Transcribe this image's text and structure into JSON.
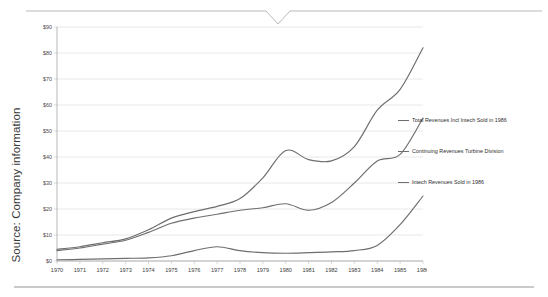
{
  "source_note": "Source: Company information",
  "decoration": {
    "top_rule_name": "top-divider-with-notch",
    "bottom_rule_name": "bottom-divider"
  },
  "legend": {
    "position": "right",
    "items": [
      {
        "label": "Total Revenues Incl Intech  Sold in 1986",
        "color": "#6e6e6e"
      },
      {
        "label": "Continuing Revenues Turbine Division",
        "color": "#6e6e6e"
      },
      {
        "label": "Intech Revenues Sold in 1986",
        "color": "#6e6e6e"
      }
    ]
  },
  "chart_data": {
    "type": "line",
    "title": "",
    "subtitle": "",
    "xlabel": "",
    "ylabel": "",
    "grid": true,
    "legend_position": "right",
    "xlim": [
      1970,
      1986
    ],
    "ylim": [
      0,
      90
    ],
    "ytick_step": 10,
    "ytick_prefix": "$",
    "ytick_labels": [
      "$0",
      "$10",
      "$20",
      "$30",
      "$40",
      "$50",
      "$60",
      "$70",
      "$80",
      "$90"
    ],
    "ytick_values": [
      0,
      10,
      20,
      30,
      40,
      50,
      60,
      70,
      80,
      90
    ],
    "categories": [
      1970,
      1971,
      1972,
      1973,
      1974,
      1975,
      1976,
      1977,
      1978,
      1979,
      1980,
      1981,
      1982,
      1983,
      1984,
      1985,
      1986
    ],
    "xtick_labels": [
      "1970",
      "1971",
      "1972",
      "1973",
      "1974",
      "1975",
      "1976",
      "1977",
      "1978",
      "1979",
      "1980",
      "1981",
      "1982",
      "1983",
      "1984",
      "1985",
      "1986"
    ],
    "series": [
      {
        "name": "Total Revenues Incl Intech  Sold in 1986",
        "color": "#6e6e6e",
        "values": [
          4.5,
          5.5,
          7.0,
          8.5,
          12.0,
          16.5,
          19.0,
          21.0,
          24.0,
          32.0,
          42.5,
          39.0,
          38.5,
          44.0,
          58.0,
          66.0,
          82.0
        ]
      },
      {
        "name": "Continuing Revenues Turbine Division",
        "color": "#6e6e6e",
        "values": [
          4.0,
          5.0,
          6.5,
          8.0,
          11.0,
          14.5,
          16.5,
          18.0,
          19.5,
          20.5,
          22.0,
          19.5,
          22.5,
          30.0,
          38.5,
          41.0,
          55.0
        ]
      },
      {
        "name": "Intech Revenues Sold in 1986",
        "color": "#6e6e6e",
        "values": [
          0.5,
          0.6,
          0.8,
          1.0,
          1.2,
          2.0,
          4.0,
          5.5,
          4.0,
          3.2,
          3.0,
          3.2,
          3.5,
          4.0,
          6.0,
          14.0,
          25.0
        ]
      }
    ]
  }
}
